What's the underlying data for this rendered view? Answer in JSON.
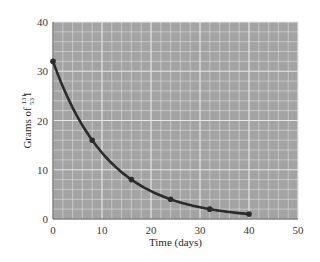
{
  "chart_data": {
    "type": "line",
    "title": "",
    "xlabel": "Time (days)",
    "ylabel": "Grams of ¹³¹₅₃I",
    "ylabel_parts": {
      "prefix": "Grams of ",
      "mass": "131",
      "atomic": "53",
      "symbol": "I"
    },
    "x": [
      0,
      8,
      16,
      24,
      32,
      40
    ],
    "series": [
      {
        "name": "I-131 remaining",
        "values": [
          32,
          16,
          8,
          4,
          2,
          1
        ],
        "color": "#2b2b2b"
      }
    ],
    "xlim": [
      0,
      50
    ],
    "ylim": [
      0,
      40
    ],
    "x_ticks": [
      0,
      10,
      20,
      30,
      40,
      50
    ],
    "y_ticks": [
      0,
      10,
      20,
      30,
      40
    ],
    "grid": true,
    "minor_grid_step": {
      "x": 2,
      "y": 2
    },
    "major_grid_step": {
      "x": 10,
      "y": 10
    },
    "plot_bg": "#a3a3a3",
    "grid_color": "#e6e6e6",
    "legend": null,
    "curve": "exponential decay, half-life 8 days"
  }
}
